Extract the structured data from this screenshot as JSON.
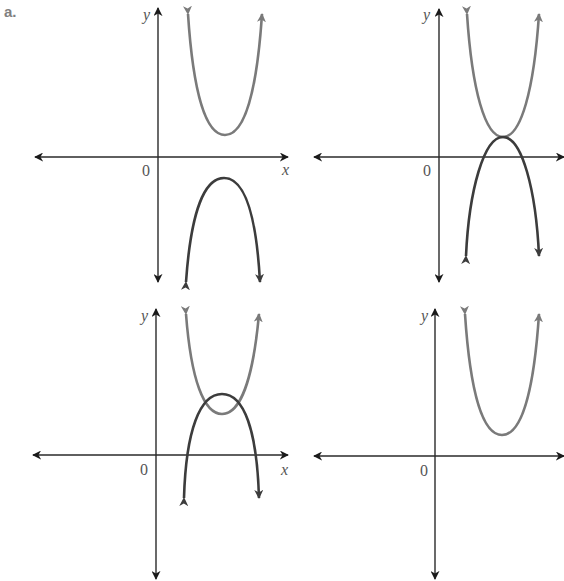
{
  "figure_label": "a.",
  "colors": {
    "axis": "#2a2a2a",
    "upward_parabola": "#7a7a7a",
    "downward_parabola": "#3c3c3c",
    "label": "#808080"
  },
  "panels": [
    {
      "position": "top-left",
      "axis_labels": {
        "x": "x",
        "y": "y",
        "origin": "0"
      },
      "curves": [
        {
          "type": "upward parabola",
          "vertex_position": "above x-axis"
        },
        {
          "type": "downward parabola",
          "vertex_position": "below x-axis"
        }
      ],
      "description": "No intersection"
    },
    {
      "position": "top-right",
      "axis_labels": {
        "x": "x",
        "y": "y",
        "origin": "0"
      },
      "curves": [
        {
          "type": "upward parabola",
          "vertex_position": "above x-axis"
        },
        {
          "type": "downward parabola",
          "vertex_position": "above x-axis, touching upward vertex"
        }
      ],
      "description": "One point of intersection (tangent)"
    },
    {
      "position": "bottom-left",
      "axis_labels": {
        "x": "x",
        "y": "y",
        "origin": "0"
      },
      "curves": [
        {
          "type": "upward parabola",
          "vertex_position": "above x-axis"
        },
        {
          "type": "downward parabola",
          "vertex_position": "above upward vertex"
        }
      ],
      "description": "Two points of intersection"
    },
    {
      "position": "bottom-right",
      "axis_labels": {
        "x": "x",
        "y": "y",
        "origin": "0"
      },
      "curves": [
        {
          "type": "upward parabola",
          "vertex_position": "above x-axis"
        }
      ],
      "description": "Single parabola"
    }
  ]
}
